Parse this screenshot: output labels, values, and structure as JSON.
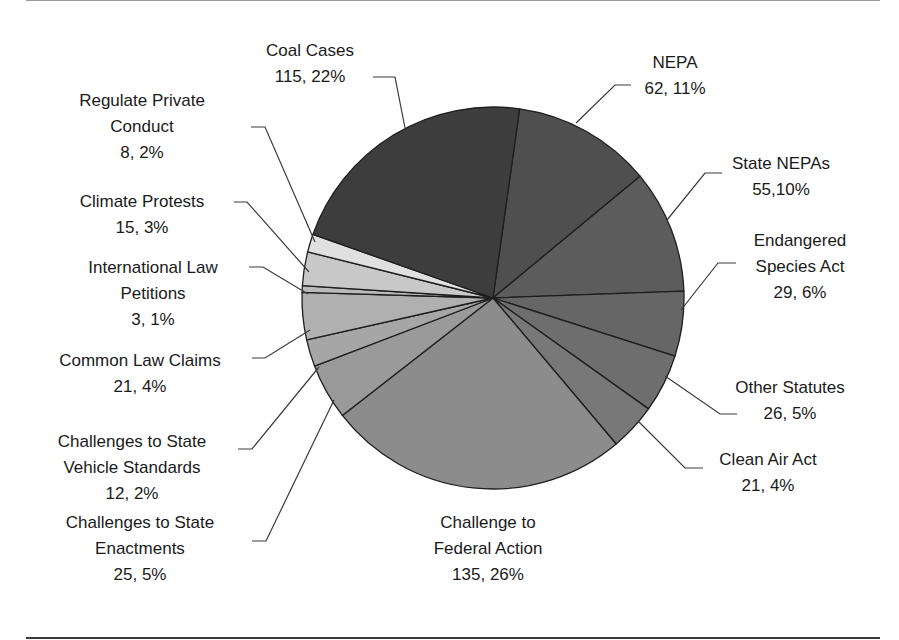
{
  "chart_data": {
    "type": "pie",
    "title": "",
    "start_angle_deg": 8,
    "direction": "clockwise",
    "total": 527,
    "slices": [
      {
        "label": "NEPA",
        "value": 62,
        "percent": "11%",
        "text": "62, 11%",
        "color": "#4f4f4f"
      },
      {
        "label": "State NEPAs",
        "value": 55,
        "percent": "10%",
        "text": "55,10%",
        "color": "#5c5c5c"
      },
      {
        "label": "Endangered Species Act",
        "value": 29,
        "percent": "6%",
        "text": "29, 6%",
        "color": "#666666"
      },
      {
        "label": "Other Statutes",
        "value": 26,
        "percent": "5%",
        "text": "26, 5%",
        "color": "#6e6e6e"
      },
      {
        "label": "Clean Air Act",
        "value": 21,
        "percent": "4%",
        "text": "21, 4%",
        "color": "#787878"
      },
      {
        "label": "Challenge to Federal Action",
        "value": 135,
        "percent": "26%",
        "text": "135, 26%",
        "color": "#8c8c8c"
      },
      {
        "label": "Challenges to State Enactments",
        "value": 25,
        "percent": "5%",
        "text": "25, 5%",
        "color": "#9a9a9a"
      },
      {
        "label": "Challenges to State Vehicle Standards",
        "value": 12,
        "percent": "2%",
        "text": "12, 2%",
        "color": "#a6a6a6"
      },
      {
        "label": "Common Law Claims",
        "value": 21,
        "percent": "4%",
        "text": "21, 4%",
        "color": "#b0b0b0"
      },
      {
        "label": "International Law Petitions",
        "value": 3,
        "percent": "1%",
        "text": "3, 1%",
        "color": "#bababa"
      },
      {
        "label": "Climate Protests",
        "value": 15,
        "percent": "3%",
        "text": "15, 3%",
        "color": "#c8c8c8"
      },
      {
        "label": "Regulate Private Conduct",
        "value": 8,
        "percent": "2%",
        "text": "8, 2%",
        "color": "#e0e0e0"
      },
      {
        "label": "Coal Cases",
        "value": 115,
        "percent": "22%",
        "text": "115, 22%",
        "color": "#3d3d3d"
      }
    ],
    "legend": "none (callout labels)",
    "grid": false
  },
  "labels": {
    "coal": {
      "line1": "Coal Cases",
      "line2": "115, 22%"
    },
    "nepa": {
      "line1": "NEPA",
      "line2": "62, 11%"
    },
    "state_nepas": {
      "line1": "State NEPAs",
      "line2": "55,10%"
    },
    "esa": {
      "line1": "Endangered",
      "line2": "Species Act",
      "line3": "29, 6%"
    },
    "other_statutes": {
      "line1": "Other Statutes",
      "line2": "26, 5%"
    },
    "clean_air": {
      "line1": "Clean Air Act",
      "line2": "21, 4%"
    },
    "federal": {
      "line1": "Challenge to",
      "line2": "Federal Action",
      "line3": "135, 26%"
    },
    "state_enactments": {
      "line1": "Challenges to State",
      "line2": "Enactments",
      "line3": "25, 5%"
    },
    "vehicle": {
      "line1": "Challenges to State",
      "line2": "Vehicle Standards",
      "line3": "12, 2%"
    },
    "common_law": {
      "line1": "Common Law Claims",
      "line2": "21, 4%"
    },
    "international": {
      "line1": "International Law",
      "line2": "Petitions",
      "line3": "3, 1%"
    },
    "climate_protests": {
      "line1": "Climate Protests",
      "line2": "15, 3%"
    },
    "regulate_private": {
      "line1": "Regulate Private",
      "line2": "Conduct",
      "line3": "8, 2%"
    }
  }
}
